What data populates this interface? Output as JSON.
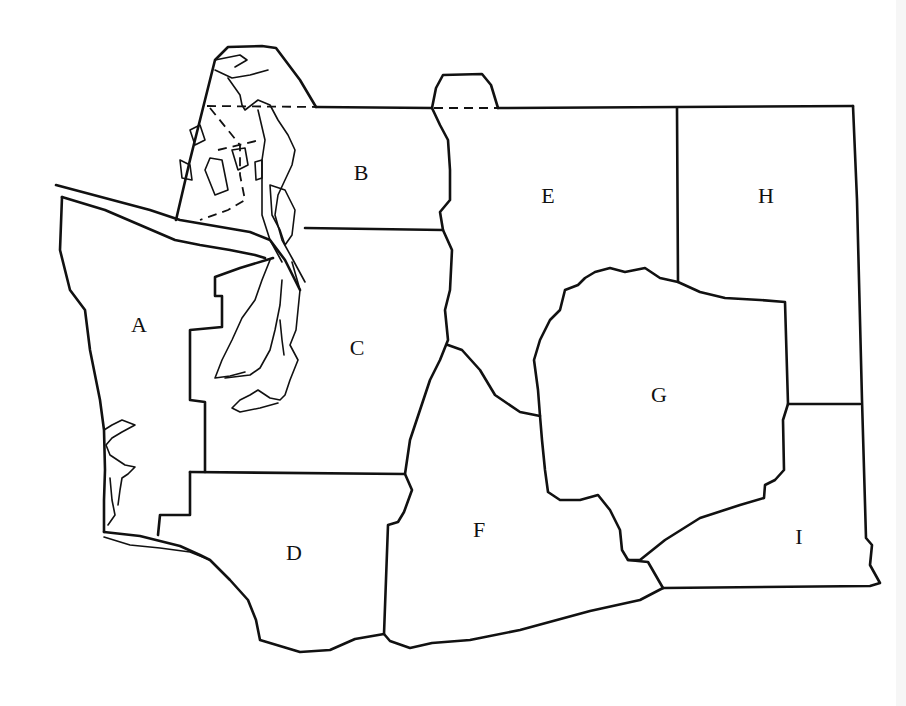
{
  "map": {
    "type": "region outline map",
    "style": "black line drawing on white",
    "regions": [
      {
        "id": "A",
        "label": "A",
        "x": 139,
        "y": 325
      },
      {
        "id": "B",
        "label": "B",
        "x": 361,
        "y": 173
      },
      {
        "id": "C",
        "label": "C",
        "x": 357,
        "y": 348
      },
      {
        "id": "D",
        "label": "D",
        "x": 294,
        "y": 553
      },
      {
        "id": "E",
        "label": "E",
        "x": 548,
        "y": 196
      },
      {
        "id": "F",
        "label": "F",
        "x": 479,
        "y": 530
      },
      {
        "id": "G",
        "label": "G",
        "x": 659,
        "y": 395
      },
      {
        "id": "H",
        "label": "H",
        "x": 766,
        "y": 196
      },
      {
        "id": "I",
        "label": "I",
        "x": 799,
        "y": 537
      }
    ],
    "colors": {
      "line": "#111111",
      "background": "#ffffff"
    }
  }
}
